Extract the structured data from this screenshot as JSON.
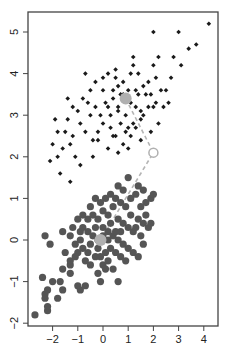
{
  "chart_data": {
    "type": "scatter",
    "title": "",
    "xlabel": "",
    "ylabel": "",
    "xlim": [
      -2.9,
      4.6
    ],
    "ylim": [
      -2.05,
      5.45
    ],
    "x_ticks": [
      -2,
      -1,
      0,
      1,
      2,
      3,
      4
    ],
    "x_tick_labels": [
      "−2",
      "−1",
      "0",
      "1",
      "2",
      "3",
      "4"
    ],
    "y_ticks": [
      -2,
      -1,
      0,
      1,
      2,
      3,
      4,
      5
    ],
    "y_tick_labels": [
      "−2",
      "−1",
      "0",
      "1",
      "2",
      "3",
      "4",
      "5"
    ],
    "grid": false,
    "legend": null,
    "series": [
      {
        "name": "cluster-upper",
        "marker": "diamond",
        "color": "#1a1a1a",
        "points": [
          [
            4.2,
            5.2
          ],
          [
            3.0,
            5.0
          ],
          [
            2.0,
            5.0
          ],
          [
            3.7,
            4.7
          ],
          [
            3.4,
            4.6
          ],
          [
            2.8,
            4.4
          ],
          [
            2.2,
            4.4
          ],
          [
            2.0,
            4.2
          ],
          [
            3.1,
            4.2
          ],
          [
            1.2,
            4.4
          ],
          [
            1.2,
            4.2
          ],
          [
            1.1,
            4.0
          ],
          [
            2.1,
            3.9
          ],
          [
            1.8,
            3.8
          ],
          [
            1.6,
            3.7
          ],
          [
            2.5,
            3.6
          ],
          [
            2.3,
            3.6
          ],
          [
            1.7,
            3.5
          ],
          [
            1.4,
            3.5
          ],
          [
            1.0,
            3.6
          ],
          [
            0.8,
            3.8
          ],
          [
            0.6,
            3.7
          ],
          [
            0.8,
            3.5
          ],
          [
            1.1,
            3.3
          ],
          [
            1.3,
            3.2
          ],
          [
            1.6,
            3.0
          ],
          [
            2.0,
            3.2
          ],
          [
            2.4,
            3.2
          ],
          [
            2.6,
            3.3
          ],
          [
            2.2,
            2.8
          ],
          [
            1.9,
            2.6
          ],
          [
            1.5,
            2.9
          ],
          [
            0.5,
            3.9
          ],
          [
            0.4,
            3.6
          ],
          [
            0.2,
            3.2
          ],
          [
            0.3,
            3.0
          ],
          [
            0.6,
            3.1
          ],
          [
            0.7,
            2.8
          ],
          [
            0.9,
            2.6
          ],
          [
            1.1,
            2.5
          ],
          [
            1.3,
            2.7
          ],
          [
            1.5,
            2.4
          ],
          [
            0.8,
            2.3
          ],
          [
            0.5,
            2.5
          ],
          [
            0.3,
            2.7
          ],
          [
            0.0,
            2.8
          ],
          [
            -0.1,
            3.0
          ],
          [
            -0.3,
            3.2
          ],
          [
            -0.5,
            3.0
          ],
          [
            -0.2,
            2.6
          ],
          [
            -0.4,
            2.4
          ],
          [
            -0.7,
            2.6
          ],
          [
            -0.9,
            2.8
          ],
          [
            -1.2,
            2.5
          ],
          [
            -1.5,
            2.6
          ],
          [
            -1.3,
            2.3
          ],
          [
            -1.1,
            2.0
          ],
          [
            -0.9,
            1.8
          ],
          [
            -1.6,
            2.2
          ],
          [
            -1.9,
            2.9
          ],
          [
            -1.8,
            2.6
          ],
          [
            -2.0,
            2.3
          ],
          [
            -2.1,
            1.9
          ],
          [
            -1.7,
            1.6
          ],
          [
            -1.3,
            1.4
          ],
          [
            -1.4,
            2.9
          ],
          [
            -1.0,
            3.1
          ],
          [
            -0.6,
            3.3
          ],
          [
            -1.4,
            3.4
          ],
          [
            -0.8,
            3.4
          ],
          [
            0.0,
            3.6
          ],
          [
            0.1,
            3.3
          ],
          [
            0.4,
            3.4
          ],
          [
            0.6,
            3.2
          ],
          [
            0.9,
            3.0
          ],
          [
            1.2,
            2.8
          ],
          [
            1.5,
            3.1
          ],
          [
            1.8,
            3.2
          ],
          [
            0.2,
            4.0
          ],
          [
            0.0,
            3.9
          ],
          [
            -0.5,
            3.6
          ],
          [
            -1.2,
            3.2
          ],
          [
            -1.8,
            2.0
          ],
          [
            -0.4,
            2.0
          ],
          [
            0.2,
            2.2
          ],
          [
            0.6,
            2.1
          ],
          [
            1.0,
            2.2
          ],
          [
            0.9,
            3.4
          ],
          [
            0.7,
            3.5
          ],
          [
            1.3,
            3.6
          ],
          [
            1.9,
            3.5
          ],
          [
            2.1,
            3.3
          ],
          [
            2.7,
            3.9
          ],
          [
            1.4,
            4.0
          ],
          [
            0.5,
            4.1
          ],
          [
            -0.3,
            3.8
          ],
          [
            -0.7,
            4.0
          ],
          [
            -0.2,
            2.4
          ],
          [
            0.4,
            2.5
          ],
          [
            1.0,
            2.7
          ]
        ]
      },
      {
        "name": "cluster-lower",
        "marker": "circle",
        "color": "#555555",
        "points": [
          [
            -2.7,
            -1.8
          ],
          [
            -2.2,
            -1.7
          ],
          [
            -2.2,
            -1.6
          ],
          [
            -2.3,
            -1.3
          ],
          [
            -2.2,
            -1.2
          ],
          [
            -2.3,
            -1.4
          ],
          [
            -2.4,
            -0.9
          ],
          [
            -2.0,
            -1.0
          ],
          [
            -1.8,
            -1.4
          ],
          [
            -1.6,
            -1.2
          ],
          [
            -1.7,
            -1.0
          ],
          [
            -1.6,
            -0.7
          ],
          [
            -1.3,
            -0.8
          ],
          [
            -1.3,
            -0.6
          ],
          [
            -1.0,
            -1.1
          ],
          [
            -0.9,
            -1.2
          ],
          [
            -0.7,
            -1.1
          ],
          [
            -1.5,
            -0.3
          ],
          [
            -1.3,
            -0.5
          ],
          [
            -1.0,
            -0.3
          ],
          [
            -2.1,
            -0.1
          ],
          [
            -2.3,
            0.1
          ],
          [
            -1.3,
            0.1
          ],
          [
            -1.1,
            -0.1
          ],
          [
            -0.9,
            0.0
          ],
          [
            -0.8,
            -0.2
          ],
          [
            -0.6,
            -0.3
          ],
          [
            -0.5,
            -0.6
          ],
          [
            -0.3,
            -0.4
          ],
          [
            -0.2,
            -0.8
          ],
          [
            0.0,
            -0.6
          ],
          [
            0.2,
            -0.5
          ],
          [
            -0.8,
            0.3
          ],
          [
            -0.6,
            0.2
          ],
          [
            -0.4,
            0.1
          ],
          [
            -0.2,
            0.0
          ],
          [
            0.0,
            0.3
          ],
          [
            0.2,
            0.2
          ],
          [
            0.4,
            0.1
          ],
          [
            0.6,
            0.0
          ],
          [
            0.8,
            -0.1
          ],
          [
            0.3,
            -0.2
          ],
          [
            0.5,
            -0.3
          ],
          [
            0.7,
            -0.4
          ],
          [
            0.9,
            -0.5
          ],
          [
            1.0,
            -0.2
          ],
          [
            0.4,
            -0.7
          ],
          [
            0.6,
            -1.0
          ],
          [
            -0.1,
            -1.0
          ],
          [
            -0.6,
            0.5
          ],
          [
            -0.4,
            0.6
          ],
          [
            -0.2,
            0.5
          ],
          [
            0.0,
            0.7
          ],
          [
            0.2,
            0.6
          ],
          [
            0.4,
            0.8
          ],
          [
            0.6,
            0.5
          ],
          [
            0.8,
            0.4
          ],
          [
            1.0,
            0.3
          ],
          [
            1.2,
            0.2
          ],
          [
            1.4,
            0.5
          ],
          [
            1.6,
            0.4
          ],
          [
            1.8,
            0.3
          ],
          [
            1.5,
            0.8
          ],
          [
            1.7,
            0.9
          ],
          [
            1.9,
            1.0
          ],
          [
            1.3,
            1.1
          ],
          [
            1.1,
            1.0
          ],
          [
            0.9,
            0.8
          ],
          [
            0.7,
            0.9
          ],
          [
            0.5,
            1.0
          ],
          [
            0.3,
            1.1
          ],
          [
            0.1,
            1.0
          ],
          [
            -0.1,
            0.9
          ],
          [
            -0.3,
            1.0
          ],
          [
            -0.5,
            0.8
          ],
          [
            -0.8,
            0.6
          ],
          [
            -1.0,
            0.5
          ],
          [
            -1.2,
            0.3
          ],
          [
            -0.2,
            -0.2
          ],
          [
            0.1,
            -0.3
          ],
          [
            1.1,
            0.6
          ],
          [
            1.3,
            0.3
          ],
          [
            1.5,
            0.1
          ],
          [
            1.7,
            0.6
          ],
          [
            0.8,
            1.2
          ],
          [
            0.6,
            1.3
          ],
          [
            1.0,
            1.5
          ],
          [
            1.4,
            1.3
          ],
          [
            1.6,
            1.2
          ],
          [
            2.0,
            1.1
          ],
          [
            1.2,
            -0.3
          ],
          [
            1.4,
            -0.4
          ],
          [
            0.2,
            0.0
          ],
          [
            -0.5,
            -0.1
          ],
          [
            -0.7,
            -0.5
          ],
          [
            -1.1,
            -0.4
          ],
          [
            0.0,
            0.1
          ],
          [
            0.3,
            0.4
          ],
          [
            0.5,
            0.2
          ],
          [
            0.7,
            0.2
          ],
          [
            -0.3,
            0.3
          ],
          [
            -0.9,
            0.2
          ],
          [
            1.9,
            0.4
          ],
          [
            1.6,
            -0.1
          ],
          [
            -1.6,
            0.2
          ],
          [
            -0.1,
            -0.4
          ],
          [
            0.1,
            -0.7
          ]
        ]
      }
    ],
    "centroids": [
      {
        "name": "centroid-upper",
        "x": 0.9,
        "y": 3.4,
        "color": "#b0b0b0"
      },
      {
        "name": "centroid-lower",
        "x": -0.1,
        "y": 0.0,
        "color": "#b0b0b0"
      }
    ],
    "open_marker": {
      "name": "initial-point",
      "x": 2.0,
      "y": 2.1,
      "color": "#b0b0b0"
    },
    "dashed_path": {
      "color": "#b5b5b5",
      "points": [
        [
          0.9,
          3.4
        ],
        [
          2.0,
          2.1
        ],
        [
          -0.1,
          0.0
        ]
      ]
    }
  }
}
